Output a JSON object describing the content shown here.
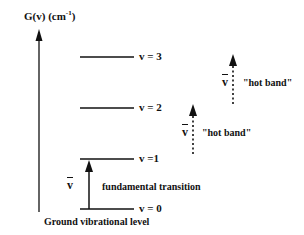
{
  "diagram": {
    "axis": {
      "label_main": "G(v) (cm",
      "label_exp": "-1",
      "label_close": ")"
    },
    "levels": [
      {
        "label": "v = 3"
      },
      {
        "label": "v = 2"
      },
      {
        "label": "v =1"
      },
      {
        "label": "v = 0"
      }
    ],
    "transitions": {
      "fundamental": {
        "symbol": "v",
        "label": "fundamental transition",
        "style": "solid"
      },
      "hot_band_1": {
        "symbol": "v",
        "label": "\"hot band\"",
        "style": "dotted"
      },
      "hot_band_2": {
        "symbol": "v",
        "label": "\"hot band\"",
        "style": "dotted"
      }
    },
    "ground_label": "Ground vibrational level",
    "colors": {
      "ink": "#111111",
      "background": "#ffffff"
    }
  }
}
